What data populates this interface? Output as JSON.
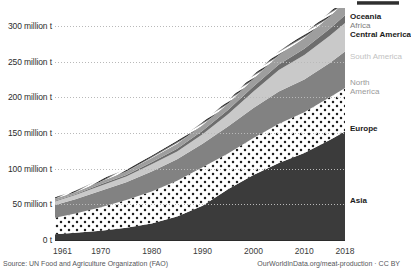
{
  "chart_data": {
    "type": "area",
    "title": "",
    "subtitle": "",
    "xlabel": "",
    "ylabel": "",
    "stacked": true,
    "grid": true,
    "legend_position": "right-inline",
    "xlim": [
      1961,
      2018
    ],
    "ylim": [
      0,
      325
    ],
    "y_unit": "million t",
    "x": [
      1961,
      1965,
      1970,
      1975,
      1980,
      1985,
      1990,
      1995,
      2000,
      2005,
      2010,
      2015,
      2018
    ],
    "yticks": [
      {
        "value": 0,
        "label": "0 t"
      },
      {
        "value": 50,
        "label": "50 million t"
      },
      {
        "value": 100,
        "label": "100 million t"
      },
      {
        "value": 150,
        "label": "150 million t"
      },
      {
        "value": 200,
        "label": "200 million t"
      },
      {
        "value": 250,
        "label": "250 million t"
      },
      {
        "value": 300,
        "label": "300 million t"
      }
    ],
    "xticks": [
      {
        "value": 1961,
        "label": "1961"
      },
      {
        "value": 1970,
        "label": "1970"
      },
      {
        "value": 1980,
        "label": "1980"
      },
      {
        "value": 1990,
        "label": "1990"
      },
      {
        "value": 2000,
        "label": "2000"
      },
      {
        "value": 2010,
        "label": "2010"
      },
      {
        "value": 2018,
        "label": "2018"
      }
    ],
    "series": [
      {
        "name": "Asia",
        "fill": "#3b3b3b",
        "pattern": "solid",
        "values": [
          8,
          10,
          13,
          17,
          23,
          33,
          48,
          71,
          91,
          108,
          122,
          140,
          152
        ]
      },
      {
        "name": "Europe",
        "fill": "#ffffff",
        "pattern": "dots",
        "values": [
          23,
          27,
          33,
          39,
          45,
          50,
          54,
          50,
          52,
          55,
          57,
          60,
          61
        ]
      },
      {
        "name": "North America",
        "fill": "#828282",
        "pattern": "solid",
        "values": [
          18,
          20,
          23,
          25,
          28,
          30,
          33,
          38,
          42,
          45,
          46,
          48,
          51
        ]
      },
      {
        "name": "South America",
        "fill": "#c9c9c9",
        "pattern": "solid",
        "values": [
          5,
          6,
          7,
          8,
          10,
          11,
          13,
          17,
          23,
          30,
          34,
          38,
          40
        ]
      },
      {
        "name": "Central America",
        "fill": "#6d6d6d",
        "pattern": "solid",
        "values": [
          1,
          1,
          2,
          2,
          3,
          4,
          5,
          6,
          7,
          8,
          9,
          10,
          11
        ]
      },
      {
        "name": "Africa",
        "fill": "#9e9e9e",
        "pattern": "solid",
        "values": [
          3,
          3,
          4,
          5,
          6,
          7,
          8,
          9,
          11,
          13,
          15,
          17,
          19
        ]
      },
      {
        "name": "Oceania",
        "fill": "#ffffff",
        "pattern": "hatch",
        "values": [
          2,
          2,
          3,
          3,
          3,
          4,
          4,
          4,
          5,
          5,
          6,
          6,
          6
        ]
      }
    ],
    "legend_labels": [
      {
        "name": "Oceania",
        "text": "Oceania",
        "tone": "dark"
      },
      {
        "name": "Africa",
        "text": "Africa",
        "tone": "mid"
      },
      {
        "name": "Central America",
        "text": "Central America",
        "tone": "dark"
      },
      {
        "name": "South America",
        "text": "South America",
        "tone": "light"
      },
      {
        "name": "North America",
        "text": "North\nAmerica",
        "tone": "grey",
        "line1": "North",
        "line2": "America"
      },
      {
        "name": "Europe",
        "text": "Europe",
        "tone": "dark"
      },
      {
        "name": "Asia",
        "text": "Asia",
        "tone": "dark"
      }
    ]
  },
  "footer": {
    "source": "Source: UN Food and Agriculture Organization (FAO)",
    "attribution": "OurWorldInData.org/meat-production · CC BY"
  }
}
